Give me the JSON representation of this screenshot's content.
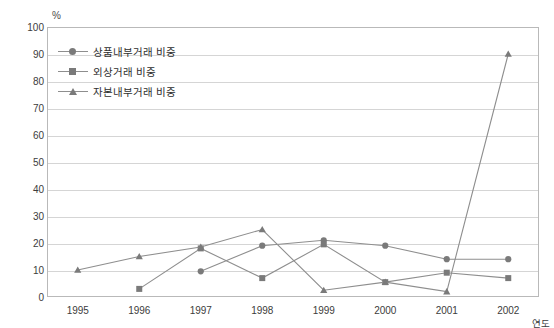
{
  "chart_data": {
    "type": "line",
    "title": "",
    "xlabel": "연도",
    "ylabel": "%",
    "ylim": [
      0,
      100
    ],
    "ytick_step": 10,
    "grid": true,
    "legend_position": "top-left-inside",
    "categories": [
      "1995",
      "1996",
      "1997",
      "1998",
      "1999",
      "2000",
      "2001",
      "2002"
    ],
    "yticks": [
      "100",
      "90",
      "80",
      "70",
      "60",
      "50",
      "40",
      "30",
      "20",
      "10",
      "0"
    ],
    "series": [
      {
        "name": "상품내부거래 비중",
        "marker": "circle",
        "color": "#8e8e8e",
        "x": [
          "1997",
          "1998",
          "1999",
          "2000",
          "2001",
          "2002"
        ],
        "values": [
          9.5,
          19.0,
          21.0,
          19.0,
          14.0,
          14.0
        ]
      },
      {
        "name": "외상거래 비중",
        "marker": "square",
        "color": "#8e8e8e",
        "x": [
          "1996",
          "1997",
          "1998",
          "1999",
          "2000",
          "2001",
          "2002"
        ],
        "values": [
          3.0,
          18.0,
          7.0,
          19.5,
          5.5,
          9.0,
          7.0
        ]
      },
      {
        "name": "자본내부거래 비중",
        "marker": "triangle",
        "color": "#8e8e8e",
        "x": [
          "1995",
          "1996",
          "1997",
          "1998",
          "1999",
          "2000",
          "2001",
          "2002"
        ],
        "values": [
          10.0,
          15.0,
          18.5,
          25.0,
          2.5,
          5.5,
          2.0,
          90.0
        ]
      }
    ]
  },
  "colors": {
    "line": "#8e8e8e",
    "marker": "#7a7a7a",
    "grid": "#d5d5d5",
    "frame": "#b9b9b9",
    "text": "#3c3c3c"
  }
}
